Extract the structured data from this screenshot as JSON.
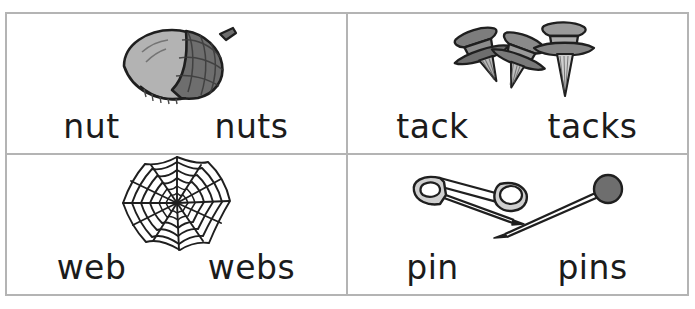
{
  "worksheet": {
    "title": "Singular and Plural Picture Word Cards",
    "border_color": "#b4b4b4",
    "background": "#ffffff",
    "columns": 2,
    "rows": 2,
    "cells": [
      {
        "id": "nut",
        "icon": "acorn-illustration",
        "singular": "nut",
        "plural": "nuts",
        "art_colors": {
          "body": "#b3b3b3",
          "cap": "#6e6e6e",
          "outline": "#1f1f1f",
          "highlight": "#d8d8d8"
        }
      },
      {
        "id": "tack",
        "icon": "thumbtacks-illustration",
        "singular": "tack",
        "plural": "tacks",
        "art_colors": {
          "body": "#9b9b9b",
          "cap": "#6e6e6e",
          "outline": "#1f1f1f",
          "highlight": "#d0d0d0"
        }
      },
      {
        "id": "web",
        "icon": "spider-web-illustration",
        "singular": "web",
        "plural": "webs",
        "art_colors": {
          "body": "#ffffff",
          "cap": "#ffffff",
          "outline": "#1f1f1f",
          "highlight": "#ffffff"
        }
      },
      {
        "id": "pin",
        "icon": "pins-illustration",
        "singular": "pin",
        "plural": "pins",
        "art_colors": {
          "body": "#c9c9c9",
          "cap": "#6e6e6e",
          "outline": "#1f1f1f",
          "highlight": "#ededed"
        }
      }
    ]
  }
}
